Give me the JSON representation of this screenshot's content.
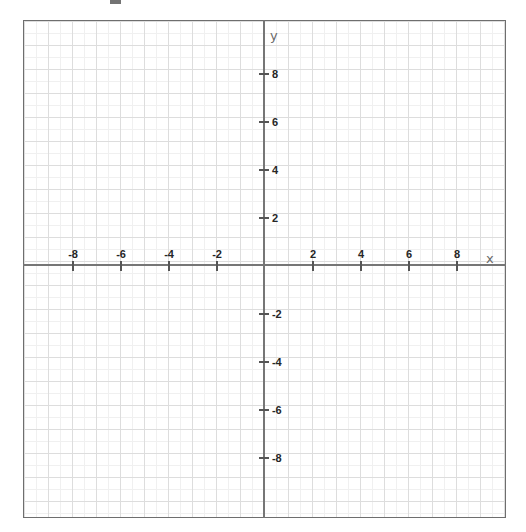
{
  "chart_data": {
    "type": "scatter",
    "title": "",
    "subtitle": "",
    "xlabel": "x",
    "ylabel": "y",
    "xlim": [
      -10,
      10
    ],
    "ylim": [
      -10.17,
      10.54
    ],
    "grid": true,
    "grid_minor_step": 0.5,
    "grid_major_step": 1,
    "legend": "none",
    "x_ticks": [
      -8,
      -6,
      -4,
      -2,
      2,
      4,
      6,
      8
    ],
    "y_ticks": [
      8,
      6,
      4,
      2,
      -2,
      -4,
      -6,
      -8
    ],
    "x_tick_labels": [
      "-8",
      "-6",
      "-4",
      "-2",
      "2",
      "4",
      "6",
      "8"
    ],
    "y_tick_labels": [
      "8",
      "6",
      "4",
      "2",
      "-2",
      "-4",
      "-6",
      "-8"
    ],
    "series": [],
    "annotations": []
  },
  "plot": {
    "origin_px": {
      "x": 264,
      "y": 265
    },
    "unit_px": 24,
    "frame_px": {
      "left": 23,
      "top": 20,
      "width": 483,
      "height": 498
    },
    "axis_name_x": "x",
    "axis_name_y": "y",
    "colors": {
      "axis": "#767676",
      "frame": "#6e6e6e",
      "grid_major": "#dddddd",
      "grid_minor": "#f0f0f0",
      "tick_label": "#262626",
      "axis_label": "#6a6a6a",
      "background": "#ffffff"
    },
    "x_tick_items": [
      {
        "label": "-8",
        "value": -8,
        "px": 72
      },
      {
        "label": "-6",
        "value": -6,
        "px": 120
      },
      {
        "label": "-4",
        "value": -4,
        "px": 168
      },
      {
        "label": "-2",
        "value": -2,
        "px": 216
      },
      {
        "label": "2",
        "value": 2,
        "px": 312
      },
      {
        "label": "4",
        "value": 4,
        "px": 360
      },
      {
        "label": "6",
        "value": 6,
        "px": 408
      },
      {
        "label": "8",
        "value": 8,
        "px": 456
      }
    ],
    "y_tick_items": [
      {
        "label": "8",
        "value": 8,
        "px": 73
      },
      {
        "label": "6",
        "value": 6,
        "px": 121
      },
      {
        "label": "4",
        "value": 4,
        "px": 169
      },
      {
        "label": "2",
        "value": 2,
        "px": 217
      },
      {
        "label": "-2",
        "value": -2,
        "px": 313
      },
      {
        "label": "-4",
        "value": -4,
        "px": 361
      },
      {
        "label": "-6",
        "value": -6,
        "px": 409
      },
      {
        "label": "-8",
        "value": -8,
        "px": 457
      }
    ]
  }
}
